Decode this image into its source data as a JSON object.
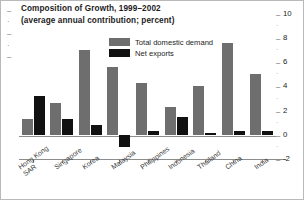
{
  "chart_data": {
    "type": "bar",
    "title": "Composition of Growth, 1999–2002",
    "subtitle": "(average annual contribution; percent)",
    "xlabel": "",
    "ylabel": "",
    "ylim": [
      -2,
      10
    ],
    "yticks": [
      -2,
      0,
      2,
      4,
      6,
      8,
      10
    ],
    "ytick_labels": [
      "-2",
      "0",
      "2",
      "4",
      "6",
      "8",
      "10"
    ],
    "yaxis_position": "right",
    "grid": false,
    "legend_position": "upper-center",
    "categories": [
      "Hong Kong SAR",
      "Singapore",
      "Korea",
      "Malaysia",
      "Philippines",
      "Indonesia",
      "Thailand",
      "China",
      "India"
    ],
    "series": [
      {
        "name": "Total domestic demand",
        "color": "#6e6e6e",
        "values": [
          1.3,
          2.6,
          7.0,
          5.6,
          4.3,
          2.3,
          4.0,
          7.6,
          5.0
        ]
      },
      {
        "name": "Net exports",
        "color": "#111111",
        "values": [
          3.2,
          1.3,
          0.8,
          -1.0,
          0.3,
          1.5,
          0.15,
          0.3,
          0.3
        ]
      }
    ]
  },
  "legend": {
    "items": [
      {
        "label": "Total domestic demand",
        "swatch": "dd"
      },
      {
        "label": "Net exports",
        "swatch": "nx"
      }
    ]
  }
}
